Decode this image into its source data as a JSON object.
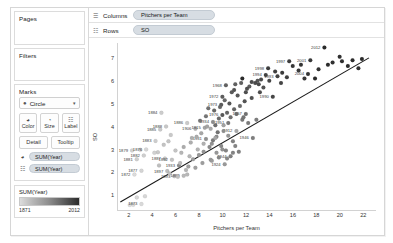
{
  "window": {
    "title": "Tableau Worksheet"
  },
  "sidebar": {
    "pages": {
      "title": "Pages"
    },
    "filters": {
      "title": "Filters"
    },
    "marks": {
      "title": "Marks",
      "mark_type": {
        "label": "Circle",
        "icon": "circle-mark-icon",
        "caret": "▾"
      },
      "buttons": [
        {
          "name": "color",
          "label": "Color",
          "icon": "◕"
        },
        {
          "name": "size",
          "label": "Size",
          "icon": "◔"
        },
        {
          "name": "label",
          "label": "Label",
          "icon": "☷"
        },
        {
          "name": "detail",
          "label": "Detail",
          "icon": ""
        },
        {
          "name": "tooltip",
          "label": "Tooltip",
          "icon": ""
        }
      ],
      "encodings": [
        {
          "icon": "◕",
          "icon_name": "color-encoding-icon",
          "field": "SUM(Year)"
        },
        {
          "icon": "☷",
          "icon_name": "label-encoding-icon",
          "field": "SUM(Year)"
        }
      ]
    },
    "legend": {
      "title": "SUM(Year)",
      "min": "1871",
      "max": "2012",
      "color_min": "#dcdcdc",
      "color_max": "#2b2b2b"
    }
  },
  "shelves": [
    {
      "name": "columns",
      "icon": "☰",
      "label": "Columns",
      "pill": "Pitchers per Team"
    },
    {
      "name": "rows",
      "icon": "☷",
      "label": "Rows",
      "pill": "SO"
    }
  ],
  "chart_data": {
    "type": "scatter",
    "title": "",
    "xlabel": "Pitchers per Team",
    "ylabel": "SO",
    "xlim": [
      1.0,
      23.0
    ],
    "ylim": [
      0.4,
      7.7
    ],
    "xticks": [
      2,
      4,
      6,
      8,
      10,
      12,
      14,
      16,
      18,
      20,
      22
    ],
    "yticks": [
      1,
      2,
      3,
      4,
      5,
      6,
      7
    ],
    "grid": false,
    "legend_position": "sidebar",
    "trendline": {
      "show": true,
      "x0": 1.2,
      "y0": 0.75,
      "x1": 22.4,
      "y1": 7.05
    },
    "color_field": "Year",
    "color_min_value": 1871,
    "color_max_value": 2012,
    "points": [
      {
        "x": 2.0,
        "y": 0.62,
        "year": 1871,
        "label": ""
      },
      {
        "x": 2.3,
        "y": 0.63,
        "year": 1872,
        "label": ""
      },
      {
        "x": 3.0,
        "y": 0.66,
        "year": 1873,
        "label": "1873"
      },
      {
        "x": 2.6,
        "y": 0.95,
        "year": 1874,
        "label": ""
      },
      {
        "x": 3.3,
        "y": 1.0,
        "year": 1875,
        "label": ""
      },
      {
        "x": 2.4,
        "y": 1.95,
        "year": 1872,
        "label": "1872"
      },
      {
        "x": 3.0,
        "y": 2.12,
        "year": 1877,
        "label": "1877"
      },
      {
        "x": 2.6,
        "y": 2.62,
        "year": 1881,
        "label": "1881"
      },
      {
        "x": 2.2,
        "y": 3.0,
        "year": 1879,
        "label": "1879"
      },
      {
        "x": 2.9,
        "y": 3.03,
        "year": 1878,
        "label": ""
      },
      {
        "x": 3.4,
        "y": 3.05,
        "year": 1876,
        "label": "1876"
      },
      {
        "x": 3.2,
        "y": 2.78,
        "year": 1882,
        "label": "1882"
      },
      {
        "x": 4.2,
        "y": 3.42,
        "year": 1883,
        "label": "1883"
      },
      {
        "x": 4.7,
        "y": 4.65,
        "year": 1884,
        "label": "1884"
      },
      {
        "x": 4.6,
        "y": 3.92,
        "year": 1885,
        "label": "1885"
      },
      {
        "x": 5.1,
        "y": 4.05,
        "year": 1888,
        "label": "1888"
      },
      {
        "x": 5.5,
        "y": 3.68,
        "year": 1887,
        "label": ""
      },
      {
        "x": 5.3,
        "y": 3.4,
        "year": 1889,
        "label": ""
      },
      {
        "x": 4.4,
        "y": 2.92,
        "year": 1886,
        "label": ""
      },
      {
        "x": 5.0,
        "y": 2.65,
        "year": 1887,
        "label": "1887"
      },
      {
        "x": 5.6,
        "y": 2.6,
        "year": 1892,
        "label": "1892"
      },
      {
        "x": 5.2,
        "y": 2.1,
        "year": 1897,
        "label": "1897"
      },
      {
        "x": 5.8,
        "y": 1.88,
        "year": 1893,
        "label": "1893"
      },
      {
        "x": 6.6,
        "y": 1.9,
        "year": 1899,
        "label": "1899"
      },
      {
        "x": 6.2,
        "y": 2.35,
        "year": 1933,
        "label": "1933"
      },
      {
        "x": 6.9,
        "y": 4.2,
        "year": 1886,
        "label": "1886"
      },
      {
        "x": 7.6,
        "y": 3.95,
        "year": 1906,
        "label": "1906"
      },
      {
        "x": 8.4,
        "y": 4.0,
        "year": 1915,
        "label": "1915"
      },
      {
        "x": 9.1,
        "y": 4.25,
        "year": 1934,
        "label": "1934"
      },
      {
        "x": 8.5,
        "y": 3.5,
        "year": 1931,
        "label": "1931"
      },
      {
        "x": 9.0,
        "y": 3.3,
        "year": 1930,
        "label": ""
      },
      {
        "x": 9.4,
        "y": 3.6,
        "year": 1935,
        "label": ""
      },
      {
        "x": 9.8,
        "y": 3.2,
        "year": 1938,
        "label": ""
      },
      {
        "x": 10.2,
        "y": 3.0,
        "year": 1940,
        "label": ""
      },
      {
        "x": 10.6,
        "y": 2.75,
        "year": 1944,
        "label": "1944"
      },
      {
        "x": 10.1,
        "y": 2.4,
        "year": 1924,
        "label": "1924"
      },
      {
        "x": 10.8,
        "y": 3.4,
        "year": 1943,
        "label": ""
      },
      {
        "x": 11.1,
        "y": 3.85,
        "year": 1912,
        "label": "1912"
      },
      {
        "x": 12.5,
        "y": 3.55,
        "year": 1946,
        "label": "1946"
      },
      {
        "x": 11.6,
        "y": 4.35,
        "year": 1950,
        "label": ""
      },
      {
        "x": 10.4,
        "y": 4.2,
        "year": 1951,
        "label": "1951"
      },
      {
        "x": 11.9,
        "y": 4.6,
        "year": 1957,
        "label": "1957"
      },
      {
        "x": 9.9,
        "y": 4.55,
        "year": 1976,
        "label": "1976"
      },
      {
        "x": 9.8,
        "y": 5.0,
        "year": 1973,
        "label": "1973"
      },
      {
        "x": 9.9,
        "y": 5.35,
        "year": 1972,
        "label": "1972"
      },
      {
        "x": 10.2,
        "y": 5.85,
        "year": 1968,
        "label": "1968"
      },
      {
        "x": 11.0,
        "y": 5.9,
        "year": 1969,
        "label": ""
      },
      {
        "x": 11.5,
        "y": 5.95,
        "year": 1970,
        "label": ""
      },
      {
        "x": 12.2,
        "y": 5.8,
        "year": 1971,
        "label": ""
      },
      {
        "x": 12.9,
        "y": 6.05,
        "year": 1978,
        "label": ""
      },
      {
        "x": 13.4,
        "y": 5.75,
        "year": 1980,
        "label": ""
      },
      {
        "x": 14.2,
        "y": 5.35,
        "year": 1990,
        "label": "1990"
      },
      {
        "x": 13.6,
        "y": 6.3,
        "year": 1994,
        "label": "1994"
      },
      {
        "x": 14.6,
        "y": 6.25,
        "year": 1993,
        "label": "1993"
      },
      {
        "x": 13.8,
        "y": 6.6,
        "year": 1998,
        "label": "1998"
      },
      {
        "x": 15.6,
        "y": 6.9,
        "year": 1997,
        "label": "1997"
      },
      {
        "x": 17.4,
        "y": 6.95,
        "year": 2001,
        "label": "2001"
      },
      {
        "x": 18.6,
        "y": 7.5,
        "year": 2012,
        "label": "2012"
      },
      {
        "x": 17.2,
        "y": 6.35,
        "year": 2004,
        "label": "2004"
      },
      {
        "x": 19.3,
        "y": 6.85,
        "year": 2008,
        "label": ""
      },
      {
        "x": 20.1,
        "y": 6.9,
        "year": 2010,
        "label": ""
      },
      {
        "x": 21.0,
        "y": 6.95,
        "year": 2011,
        "label": ""
      },
      {
        "x": 21.5,
        "y": 6.6,
        "year": 2009,
        "label": ""
      },
      {
        "x": 18.1,
        "y": 6.55,
        "year": 2006,
        "label": ""
      },
      {
        "x": 16.4,
        "y": 6.5,
        "year": 2000,
        "label": ""
      },
      {
        "x": 16.9,
        "y": 6.15,
        "year": 2002,
        "label": ""
      },
      {
        "x": 15.4,
        "y": 6.2,
        "year": 1996,
        "label": ""
      },
      {
        "x": 14.9,
        "y": 5.95,
        "year": 1992,
        "label": ""
      },
      {
        "x": 13.1,
        "y": 5.55,
        "year": 1985,
        "label": ""
      },
      {
        "x": 12.4,
        "y": 5.3,
        "year": 1982,
        "label": ""
      },
      {
        "x": 11.8,
        "y": 5.15,
        "year": 1979,
        "label": ""
      },
      {
        "x": 11.2,
        "y": 5.4,
        "year": 1975,
        "label": ""
      },
      {
        "x": 10.7,
        "y": 5.55,
        "year": 1974,
        "label": ""
      },
      {
        "x": 10.5,
        "y": 5.05,
        "year": 1977,
        "label": ""
      },
      {
        "x": 10.9,
        "y": 4.8,
        "year": 1967,
        "label": ""
      },
      {
        "x": 10.3,
        "y": 4.65,
        "year": 1966,
        "label": ""
      },
      {
        "x": 9.6,
        "y": 4.4,
        "year": 1962,
        "label": ""
      },
      {
        "x": 9.3,
        "y": 4.1,
        "year": 1959,
        "label": ""
      },
      {
        "x": 9.5,
        "y": 3.8,
        "year": 1955,
        "label": ""
      },
      {
        "x": 9.1,
        "y": 3.45,
        "year": 1948,
        "label": ""
      },
      {
        "x": 8.8,
        "y": 3.15,
        "year": 1936,
        "label": ""
      },
      {
        "x": 8.3,
        "y": 2.95,
        "year": 1928,
        "label": ""
      },
      {
        "x": 7.9,
        "y": 2.8,
        "year": 1926,
        "label": ""
      },
      {
        "x": 7.4,
        "y": 2.62,
        "year": 1920,
        "label": ""
      },
      {
        "x": 7.0,
        "y": 2.3,
        "year": 1918,
        "label": ""
      },
      {
        "x": 6.8,
        "y": 2.15,
        "year": 1903,
        "label": ""
      },
      {
        "x": 6.4,
        "y": 2.9,
        "year": 1901,
        "label": ""
      },
      {
        "x": 7.2,
        "y": 3.35,
        "year": 1908,
        "label": ""
      },
      {
        "x": 7.7,
        "y": 3.6,
        "year": 1910,
        "label": ""
      },
      {
        "x": 8.1,
        "y": 3.75,
        "year": 1913,
        "label": ""
      },
      {
        "x": 8.6,
        "y": 4.05,
        "year": 1916,
        "label": ""
      },
      {
        "x": 9.2,
        "y": 4.75,
        "year": 1964,
        "label": ""
      },
      {
        "x": 9.7,
        "y": 4.9,
        "year": 1965,
        "label": ""
      },
      {
        "x": 10.1,
        "y": 5.2,
        "year": 1963,
        "label": ""
      },
      {
        "x": 11.4,
        "y": 4.95,
        "year": 1961,
        "label": ""
      },
      {
        "x": 11.9,
        "y": 5.55,
        "year": 1983,
        "label": ""
      },
      {
        "x": 12.7,
        "y": 5.95,
        "year": 1987,
        "label": ""
      },
      {
        "x": 13.2,
        "y": 6.1,
        "year": 1989,
        "label": ""
      },
      {
        "x": 14.4,
        "y": 6.45,
        "year": 1995,
        "label": ""
      },
      {
        "x": 15.0,
        "y": 6.4,
        "year": 1999,
        "label": ""
      },
      {
        "x": 15.9,
        "y": 6.7,
        "year": 2003,
        "label": ""
      },
      {
        "x": 16.6,
        "y": 6.75,
        "year": 2005,
        "label": ""
      },
      {
        "x": 19.9,
        "y": 7.1,
        "year": 2007,
        "label": ""
      },
      {
        "x": 21.8,
        "y": 7.0,
        "year": 2013,
        "label": ""
      },
      {
        "x": 10.0,
        "y": 3.85,
        "year": 1932,
        "label": ""
      },
      {
        "x": 10.4,
        "y": 3.65,
        "year": 1927,
        "label": ""
      },
      {
        "x": 11.0,
        "y": 3.2,
        "year": 1941,
        "label": ""
      },
      {
        "x": 11.3,
        "y": 2.95,
        "year": 1945,
        "label": ""
      },
      {
        "x": 9.4,
        "y": 2.9,
        "year": 1925,
        "label": ""
      },
      {
        "x": 8.9,
        "y": 2.6,
        "year": 1922,
        "label": ""
      },
      {
        "x": 8.2,
        "y": 2.45,
        "year": 1921,
        "label": ""
      },
      {
        "x": 7.6,
        "y": 2.25,
        "year": 1919,
        "label": ""
      },
      {
        "x": 6.1,
        "y": 1.85,
        "year": 1894,
        "label": ""
      },
      {
        "x": 6.9,
        "y": 1.95,
        "year": 1900,
        "label": ""
      },
      {
        "x": 5.9,
        "y": 3.0,
        "year": 1890,
        "label": ""
      },
      {
        "x": 4.9,
        "y": 3.25,
        "year": 1891,
        "label": ""
      },
      {
        "x": 4.1,
        "y": 2.9,
        "year": 1880,
        "label": ""
      },
      {
        "x": 11.7,
        "y": 4.45,
        "year": 1953,
        "label": ""
      },
      {
        "x": 12.1,
        "y": 4.2,
        "year": 1949,
        "label": ""
      },
      {
        "x": 12.8,
        "y": 4.35,
        "year": 1947,
        "label": ""
      },
      {
        "x": 10.6,
        "y": 4.45,
        "year": 1958,
        "label": ""
      },
      {
        "x": 11.1,
        "y": 4.6,
        "year": 1960,
        "label": ""
      },
      {
        "x": 10.9,
        "y": 5.65,
        "year": 1981,
        "label": ""
      },
      {
        "x": 12.0,
        "y": 5.7,
        "year": 1984,
        "label": ""
      },
      {
        "x": 12.4,
        "y": 6.0,
        "year": 1986,
        "label": ""
      },
      {
        "x": 13.0,
        "y": 5.9,
        "year": 1988,
        "label": ""
      },
      {
        "x": 13.9,
        "y": 6.05,
        "year": 1991,
        "label": ""
      },
      {
        "x": 18.9,
        "y": 6.75,
        "year": 2014,
        "label": ""
      },
      {
        "x": 20.6,
        "y": 6.7,
        "year": 2015,
        "label": ""
      },
      {
        "x": 17.8,
        "y": 6.15,
        "year": 2016,
        "label": ""
      },
      {
        "x": 9.0,
        "y": 2.55,
        "year": 1923,
        "label": ""
      },
      {
        "x": 9.9,
        "y": 3.05,
        "year": 1929,
        "label": ""
      },
      {
        "x": 10.3,
        "y": 2.65,
        "year": 1937,
        "label": ""
      },
      {
        "x": 9.6,
        "y": 2.7,
        "year": 1939,
        "label": ""
      },
      {
        "x": 10.8,
        "y": 2.9,
        "year": 1942,
        "label": ""
      },
      {
        "x": 8.5,
        "y": 4.5,
        "year": 1952,
        "label": ""
      },
      {
        "x": 8.0,
        "y": 4.3,
        "year": 1954,
        "label": ""
      },
      {
        "x": 8.7,
        "y": 4.85,
        "year": 1956,
        "label": ""
      },
      {
        "x": 11.6,
        "y": 6.15,
        "year": 2017,
        "label": ""
      },
      {
        "x": 4.5,
        "y": 2.35,
        "year": 1895,
        "label": ""
      },
      {
        "x": 5.4,
        "y": 2.0,
        "year": 1896,
        "label": ""
      },
      {
        "x": 6.3,
        "y": 2.45,
        "year": 1898,
        "label": ""
      },
      {
        "x": 7.1,
        "y": 2.75,
        "year": 1902,
        "label": ""
      },
      {
        "x": 7.8,
        "y": 3.05,
        "year": 1904,
        "label": ""
      },
      {
        "x": 8.3,
        "y": 3.3,
        "year": 1905,
        "label": ""
      },
      {
        "x": 7.3,
        "y": 3.55,
        "year": 1907,
        "label": ""
      },
      {
        "x": 6.6,
        "y": 3.15,
        "year": 1909,
        "label": ""
      },
      {
        "x": 8.9,
        "y": 3.95,
        "year": 1911,
        "label": ""
      },
      {
        "x": 9.3,
        "y": 3.55,
        "year": 1914,
        "label": ""
      },
      {
        "x": 10.0,
        "y": 4.1,
        "year": 1917,
        "label": ""
      }
    ]
  }
}
